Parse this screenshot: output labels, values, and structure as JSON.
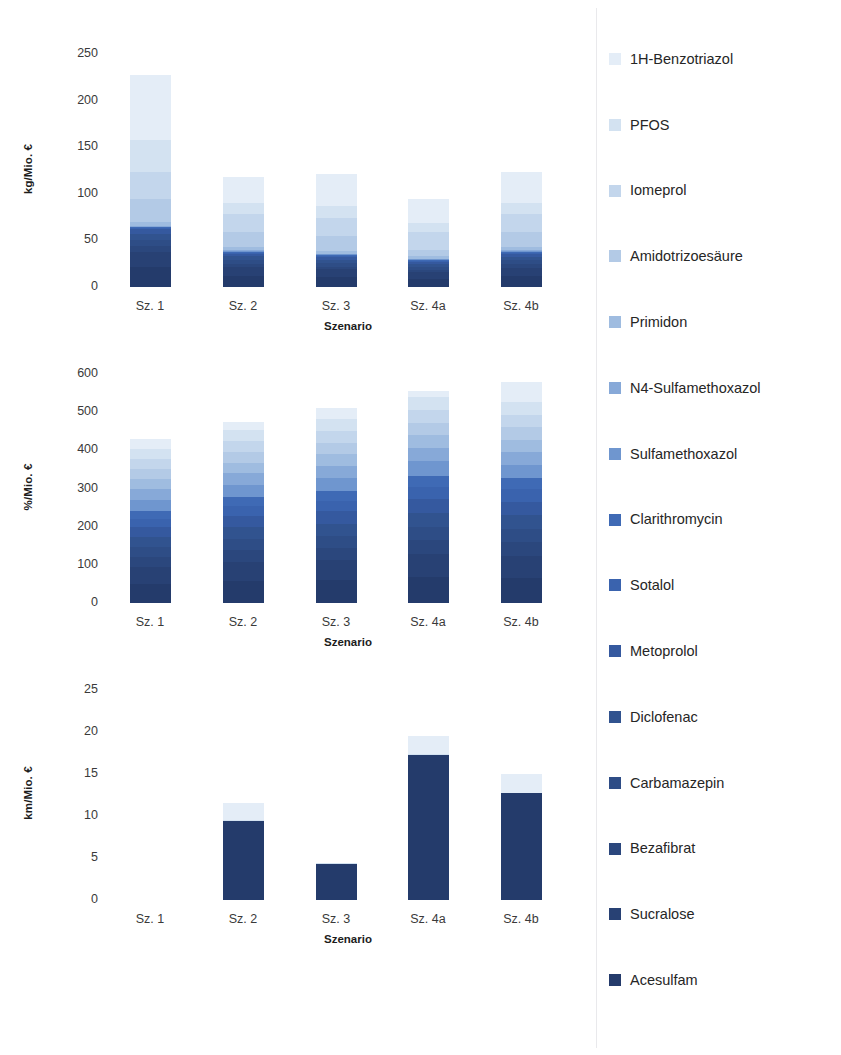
{
  "legend": {
    "position": "right",
    "items": [
      {
        "label": "1H-Benzotriazol",
        "color": "#e4edf7"
      },
      {
        "label": "PFOS",
        "color": "#d3e2f1"
      },
      {
        "label": "Iomeprol",
        "color": "#c3d6ec"
      },
      {
        "label": "Amidotrizoesäure",
        "color": "#b3cae6"
      },
      {
        "label": "Primidon",
        "color": "#9fbce0"
      },
      {
        "label": "N4-Sulfamethoxazol",
        "color": "#87a9d8"
      },
      {
        "label": "Sulfamethoxazol",
        "color": "#6f96cf"
      },
      {
        "label": "Clarithromycin",
        "color": "#3f6ab5"
      },
      {
        "label": "Sotalol",
        "color": "#3a63ae"
      },
      {
        "label": "Metoprolol",
        "color": "#35599f"
      },
      {
        "label": "Diclofenac",
        "color": "#31538f"
      },
      {
        "label": "Carbamazepin",
        "color": "#2e4d86"
      },
      {
        "label": "Bezafibrat",
        "color": "#2b477d"
      },
      {
        "label": "Sucralose",
        "color": "#284174"
      },
      {
        "label": "Acesulfam",
        "color": "#243b6b"
      }
    ]
  },
  "chart_data": [
    {
      "type": "bar",
      "stacked": true,
      "title": "",
      "xlabel": "Szenario",
      "ylabel": "kg/Mio. €",
      "ylim": [
        0,
        250
      ],
      "yticks": [
        0,
        50,
        100,
        150,
        200,
        250
      ],
      "grid": false,
      "categories": [
        "Sz. 1",
        "Sz. 2",
        "Sz. 3",
        "Sz. 4a",
        "Sz. 4b"
      ],
      "totals": [
        228,
        118,
        121,
        94,
        123
      ],
      "series": [
        {
          "name": "Acesulfam",
          "values": [
            22,
            12,
            11,
            9,
            12
          ]
        },
        {
          "name": "Sucralose",
          "values": [
            16,
            9,
            8,
            7,
            9
          ]
        },
        {
          "name": "Bezafibrat",
          "values": [
            6,
            4,
            3,
            3,
            4
          ]
        },
        {
          "name": "Carbamazepin",
          "values": [
            7,
            4,
            4,
            3,
            4
          ]
        },
        {
          "name": "Diclofenac",
          "values": [
            6,
            4,
            3,
            3,
            4
          ]
        },
        {
          "name": "Metoprolol",
          "values": [
            5,
            3,
            3,
            2,
            3
          ]
        },
        {
          "name": "Sotalol",
          "values": [
            1,
            1,
            1,
            1,
            1
          ]
        },
        {
          "name": "Clarithromycin",
          "values": [
            1,
            1,
            1,
            1,
            1
          ]
        },
        {
          "name": "Sulfamethoxazol",
          "values": [
            1,
            1,
            1,
            1,
            1
          ]
        },
        {
          "name": "N4-Sulfamethoxazol",
          "values": [
            1,
            1,
            1,
            1,
            1
          ]
        },
        {
          "name": "Primidon",
          "values": [
            4,
            3,
            3,
            3,
            3
          ]
        },
        {
          "name": "Amidotrizoesäure",
          "values": [
            25,
            16,
            16,
            6,
            17
          ]
        },
        {
          "name": "Iomeprol",
          "values": [
            28,
            19,
            19,
            20,
            19
          ]
        },
        {
          "name": "PFOS",
          "values": [
            35,
            12,
            13,
            10,
            12
          ]
        },
        {
          "name": "1H-Benzotriazol",
          "values": [
            70,
            28,
            34,
            25,
            33
          ]
        }
      ]
    },
    {
      "type": "bar",
      "stacked": true,
      "title": "",
      "xlabel": "Szenario",
      "ylabel": "%/Mio. €",
      "ylim": [
        0,
        600
      ],
      "yticks": [
        0,
        100,
        200,
        300,
        400,
        500,
        600
      ],
      "grid": false,
      "categories": [
        "Sz. 1",
        "Sz. 2",
        "Sz. 3",
        "Sz. 4a",
        "Sz. 4b"
      ],
      "totals": [
        430,
        475,
        512,
        555,
        578
      ],
      "series": [
        {
          "name": "Acesulfam",
          "values": [
            50,
            58,
            60,
            68,
            70
          ]
        },
        {
          "name": "Sucralose",
          "values": [
            44,
            50,
            52,
            60,
            62
          ]
        },
        {
          "name": "Bezafibrat",
          "values": [
            26,
            30,
            32,
            36,
            38
          ]
        },
        {
          "name": "Carbamazepin",
          "values": [
            26,
            30,
            32,
            36,
            38
          ]
        },
        {
          "name": "Diclofenac",
          "values": [
            26,
            30,
            32,
            36,
            38
          ]
        },
        {
          "name": "Metoprolol",
          "values": [
            26,
            30,
            32,
            36,
            38
          ]
        },
        {
          "name": "Sotalol",
          "values": [
            22,
            26,
            28,
            32,
            34
          ]
        },
        {
          "name": "Clarithromycin",
          "values": [
            20,
            24,
            26,
            30,
            32
          ]
        },
        {
          "name": "Sulfamethoxazol",
          "values": [
            30,
            32,
            34,
            38,
            38
          ]
        },
        {
          "name": "N4-Sulfamethoxazol",
          "values": [
            28,
            30,
            32,
            35,
            36
          ]
        },
        {
          "name": "Primidon",
          "values": [
            26,
            28,
            30,
            33,
            34
          ]
        },
        {
          "name": "Amidotrizoesäure",
          "values": [
            26,
            28,
            30,
            33,
            34
          ]
        },
        {
          "name": "Iomeprol",
          "values": [
            28,
            30,
            32,
            34,
            36
          ]
        },
        {
          "name": "PFOS",
          "values": [
            26,
            28,
            30,
            32,
            34
          ]
        },
        {
          "name": "1H-Benzotriazol",
          "values": [
            26,
            21,
            30,
            16,
            56
          ]
        }
      ]
    },
    {
      "type": "bar",
      "stacked": true,
      "title": "",
      "xlabel": "Szenario",
      "ylabel": "km/Mio. €",
      "ylim": [
        0,
        25
      ],
      "yticks": [
        0,
        5,
        10,
        15,
        20,
        25
      ],
      "grid": false,
      "categories": [
        "Sz. 1",
        "Sz. 2",
        "Sz. 3",
        "Sz. 4a",
        "Sz. 4b"
      ],
      "totals": [
        0,
        11.5,
        4.4,
        19.5,
        15.0
      ],
      "series": [
        {
          "name": "Acesulfam",
          "values": [
            0,
            9.4,
            4.3,
            17.3,
            12.7
          ]
        },
        {
          "name": "Sucralose",
          "values": [
            0,
            0,
            0,
            0,
            0
          ]
        },
        {
          "name": "Bezafibrat",
          "values": [
            0,
            0,
            0,
            0,
            0
          ]
        },
        {
          "name": "Carbamazepin",
          "values": [
            0,
            0,
            0,
            0,
            0
          ]
        },
        {
          "name": "Diclofenac",
          "values": [
            0,
            0,
            0,
            0,
            0
          ]
        },
        {
          "name": "Metoprolol",
          "values": [
            0,
            0,
            0,
            0,
            0
          ]
        },
        {
          "name": "Sotalol",
          "values": [
            0,
            0,
            0,
            0,
            0
          ]
        },
        {
          "name": "Clarithromycin",
          "values": [
            0,
            0,
            0,
            0,
            0
          ]
        },
        {
          "name": "Sulfamethoxazol",
          "values": [
            0,
            0,
            0,
            0,
            0
          ]
        },
        {
          "name": "N4-Sulfamethoxazol",
          "values": [
            0,
            0,
            0,
            0,
            0
          ]
        },
        {
          "name": "Primidon",
          "values": [
            0,
            0,
            0,
            0,
            0
          ]
        },
        {
          "name": "Amidotrizoesäure",
          "values": [
            0,
            0,
            0,
            0,
            0
          ]
        },
        {
          "name": "Iomeprol",
          "values": [
            0,
            0,
            0,
            0,
            0
          ]
        },
        {
          "name": "PFOS",
          "values": [
            0,
            0.1,
            0.1,
            0.1,
            0.1
          ]
        },
        {
          "name": "1H-Benzotriazol",
          "values": [
            0,
            2.0,
            0.0,
            2.1,
            2.2
          ]
        }
      ]
    }
  ]
}
